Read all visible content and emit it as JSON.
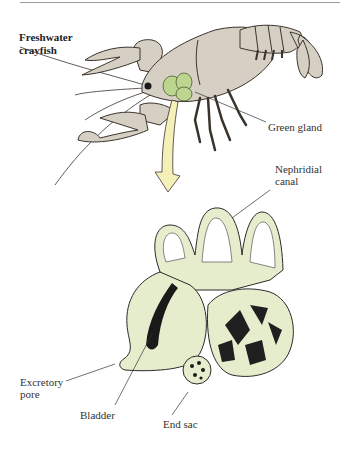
{
  "figure": {
    "title_line1": "Freshwater",
    "title_line2": "crayfish",
    "colors": {
      "body_fill": "#d6d0c4",
      "body_stroke": "#3a342c",
      "gland_fill": "#bcd68f",
      "organ_fill": "#e6edcc",
      "arrow_fill": "#f5f0b8",
      "label_text": "#333333",
      "top_rule": "#9a9a9a"
    },
    "labels": {
      "green_gland": "Green gland",
      "nephridial_canal_line1": "Nephridial",
      "nephridial_canal_line2": "canal",
      "excretory_pore_line1": "Excretory",
      "excretory_pore_line2": "pore",
      "bladder": "Bladder",
      "end_sac": "End sac"
    }
  }
}
